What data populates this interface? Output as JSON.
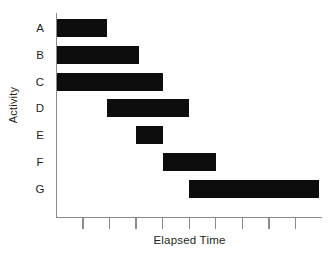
{
  "chart_data": {
    "type": "bar",
    "subtype": "gantt",
    "orientation": "horizontal",
    "title": "",
    "subtitle": "",
    "xlabel": "Elapsed Time",
    "ylabel": "Activity",
    "grid": false,
    "legend": null,
    "xlim": [
      0,
      10
    ],
    "x_tick_values": [
      1,
      2,
      3,
      4,
      5,
      6,
      7,
      8,
      9
    ],
    "x_tick_labels": [
      "",
      "",
      "",
      "",
      "",
      "",
      "",
      "",
      ""
    ],
    "categories": [
      "A",
      "B",
      "C",
      "D",
      "E",
      "F",
      "G"
    ],
    "bars": [
      {
        "category": "A",
        "start": 0.0,
        "end": 1.9,
        "duration": 1.9
      },
      {
        "category": "B",
        "start": 0.0,
        "end": 3.1,
        "duration": 3.1
      },
      {
        "category": "C",
        "start": 0.0,
        "end": 4.0,
        "duration": 4.0
      },
      {
        "category": "D",
        "start": 1.9,
        "end": 5.0,
        "duration": 3.1
      },
      {
        "category": "E",
        "start": 3.0,
        "end": 4.0,
        "duration": 1.0
      },
      {
        "category": "F",
        "start": 4.0,
        "end": 6.0,
        "duration": 2.0
      },
      {
        "category": "G",
        "start": 5.0,
        "end": 9.9,
        "duration": 4.9
      }
    ],
    "bar_color": "#0d0d0d",
    "axis_color": "#8a8a8a",
    "background_color": "#ffffff"
  },
  "axes": {
    "y_axis_title": "Activity",
    "x_axis_title": "Elapsed Time"
  }
}
